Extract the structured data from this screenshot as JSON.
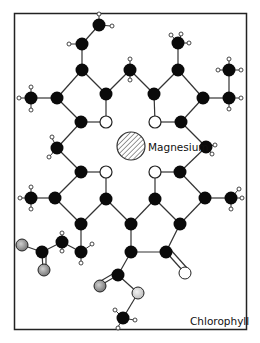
{
  "title": "Chlorophyll",
  "center_label": "Magnesium",
  "colors": {
    "carbon": "#0a0a0a",
    "nitrogen": "#ffffff",
    "oxygen_gray": "#9a9a9a",
    "oxygen_light": "#d8d8d8",
    "hydrogen": "#ffffff",
    "bond": "#333333",
    "frame": "#222222"
  },
  "legend": {
    "black_atoms": "carbon",
    "white_atoms": "nitrogen",
    "hatched_atom": "magnesium"
  }
}
